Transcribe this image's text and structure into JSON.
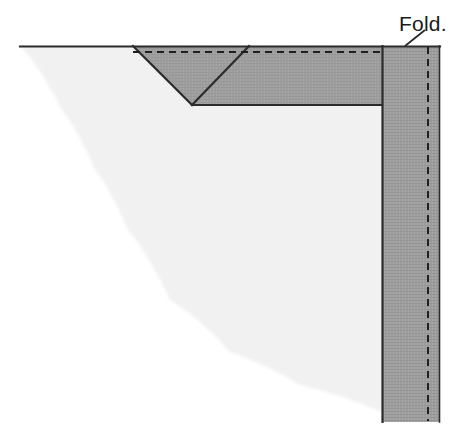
{
  "figure": {
    "type": "technical-sewing-diagram",
    "width": 468,
    "height": 438,
    "background_color": "#ffffff"
  },
  "labels": {
    "fold": "Fold.",
    "fold_position": {
      "x": 399,
      "y": 25
    }
  },
  "colors": {
    "page_background": "#ffffff",
    "light_fabric": "#f1f1f1",
    "light_fabric_edge": "#f6f6f6",
    "dark_fabric": "#9d9d9d",
    "band_fabric": "#9d9d9d",
    "outline": "#2b2b2b",
    "dash_line": "#1f1f1f",
    "label_text": "#1a1a1a"
  },
  "geometry": {
    "top_edge_line": {
      "x1": 20,
      "y1": 46,
      "x2": 440,
      "y2": 46
    },
    "dashed_horizontal": {
      "x1": 133,
      "y1": 52,
      "x2": 382,
      "y2": 52,
      "dash": "7 5"
    },
    "dashed_vertical": {
      "x1": 428,
      "y1": 47,
      "x2": 428,
      "y2": 421,
      "dash": "7 5"
    },
    "vertical_seam_line": {
      "x1": 382,
      "y1": 46,
      "x2": 382,
      "y2": 422
    },
    "right_band": {
      "x": 382,
      "y": 46,
      "width": 58,
      "height": 376
    },
    "dark_panel": {
      "x_left": 133,
      "x_right": 382,
      "y_top": 46,
      "y_bottom": 105
    },
    "v_notch": {
      "left_top": {
        "x": 133,
        "y": 46
      },
      "vertex": {
        "x": 192,
        "y": 105
      },
      "right_top": {
        "x": 249,
        "y": 46
      }
    },
    "dark_panel_bottom_line": {
      "x1": 192,
      "y1": 105,
      "x2": 382,
      "y2": 105
    },
    "leader_line": {
      "x1": 425,
      "y1": 30,
      "x2": 405,
      "y2": 46
    },
    "light_fabric_curve_points": [
      {
        "x": 20,
        "y": 46
      },
      {
        "x": 62,
        "y": 110
      },
      {
        "x": 95,
        "y": 170
      },
      {
        "x": 128,
        "y": 230
      },
      {
        "x": 170,
        "y": 300
      },
      {
        "x": 230,
        "y": 352
      },
      {
        "x": 300,
        "y": 385
      },
      {
        "x": 382,
        "y": 412
      }
    ]
  },
  "annotations": {
    "dash_pattern": "7 5",
    "stroke_width_outline": 2.2,
    "stroke_width_dash": 2,
    "stroke_width_leader": 1.8
  }
}
